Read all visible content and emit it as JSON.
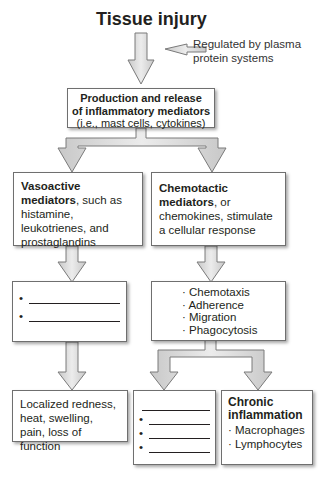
{
  "diagram": {
    "title": "Tissue injury",
    "side_note": [
      "Regulated by plasma",
      "protein systems"
    ],
    "production_box": {
      "title_lines": [
        "Production and release",
        "of inflammatory mediators"
      ],
      "subtitle": "(i.e., mast cells, cytokines)"
    },
    "vasoactive_box": {
      "bold": "Vasoactive mediators",
      "rest": ", such as histamine, leukotrienes, and prostaglandins"
    },
    "chemotactic_box": {
      "bold": "Chemotactic mediators",
      "rest": ", or chemokines, stimulate a cellular response"
    },
    "vasoactive_effects_box": {
      "bullets": [
        "•",
        "•"
      ],
      "blank_count": 2
    },
    "cellular_response_box": {
      "items": [
        "· Chemotaxis",
        "· Adherence",
        "· Migration",
        "· Phagocytosis"
      ]
    },
    "localized_box": {
      "text": "Localized redness, heat, swelling, pain, loss of function"
    },
    "acute_blank_box": {
      "bullets": [
        "•",
        "•",
        "•"
      ]
    },
    "chronic_box": {
      "title_lines": [
        "Chronic",
        "inflammation"
      ],
      "items": [
        "· Macrophages",
        "· Lymphocytes"
      ]
    },
    "colors": {
      "arrow_fill": "#d9d9d9",
      "arrow_stroke": "#7a7a7a",
      "box_border": "#6f6f6f",
      "text": "#231f20"
    }
  }
}
